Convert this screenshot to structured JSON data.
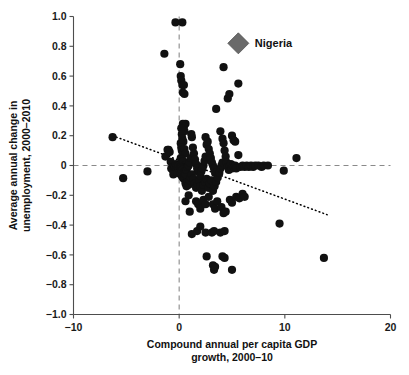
{
  "chart_data": {
    "type": "scatter",
    "title": "",
    "xlabel": "Compound annual per capita GDP growth, 2000–10",
    "xlabel_line1": "Compound annual per capita GDP",
    "xlabel_line2": "growth, 2000–10",
    "ylabel": "Average annual change in unemployment, 2000–2010",
    "ylabel_line1": "Average annual change in",
    "ylabel_line2": "unemployment, 2000–2010",
    "xlim": [
      -10,
      20
    ],
    "ylim": [
      -1.0,
      1.0
    ],
    "xticks": [
      -10,
      0,
      10,
      20
    ],
    "xtick_labels": [
      "−10",
      "0",
      "10",
      "20"
    ],
    "yticks": [
      1.0,
      0.8,
      0.6,
      0.4,
      0.2,
      0,
      -0.2,
      -0.4,
      -0.6,
      -0.8,
      -1.0
    ],
    "ytick_labels": [
      "1.0",
      "0.8",
      "0.6",
      "0.4",
      "0.2",
      "0",
      "−0.2",
      "−0.4",
      "−0.6",
      "−0.8",
      "−1.0"
    ],
    "grid": false,
    "legend_position": "none",
    "reference_lines": [
      {
        "name": "zero-unemployment-change",
        "orientation": "horizontal",
        "value": 0,
        "style": "dashed"
      },
      {
        "name": "zero-gdp-growth",
        "orientation": "vertical",
        "value": 0,
        "style": "dashed"
      }
    ],
    "trend_line": {
      "name": "fitted-trend",
      "style": "dotted",
      "x_start": -6.3,
      "y_start": 0.2,
      "x_end": 14.0,
      "y_end": -0.33,
      "slope": -0.026,
      "intercept": 0.036
    },
    "series": [
      {
        "name": "countries",
        "marker": "circle",
        "color": "#111111",
        "points": [
          [
            -6.3,
            0.19
          ],
          [
            -5.3,
            -0.085
          ],
          [
            -3.0,
            -0.04
          ],
          [
            -1.4,
            0.75
          ],
          [
            -1.3,
            0.06
          ],
          [
            -1.1,
            0.105
          ],
          [
            -1.0,
            0.105
          ],
          [
            -0.9,
            0.09
          ],
          [
            -0.8,
            0.025
          ],
          [
            -0.75,
            -0.02
          ],
          [
            -0.6,
            -0.03
          ],
          [
            -0.55,
            -0.06
          ],
          [
            -0.5,
            -0.005
          ],
          [
            -0.45,
            0.0
          ],
          [
            -0.4,
            -0.01
          ],
          [
            -0.35,
            0.96
          ],
          [
            -0.3,
            0.01
          ],
          [
            -0.25,
            -0.02
          ],
          [
            -0.2,
            0.0
          ],
          [
            -0.15,
            -0.05
          ],
          [
            -0.1,
            -0.015
          ],
          [
            -0.05,
            0.0
          ],
          [
            0.3,
            0.96
          ],
          [
            0.1,
            0.68
          ],
          [
            0.15,
            0.6
          ],
          [
            0.2,
            0.57
          ],
          [
            0.3,
            0.54
          ],
          [
            0.35,
            0.49
          ],
          [
            0.45,
            0.54
          ],
          [
            0.5,
            0.48
          ],
          [
            0.6,
            0.28
          ],
          [
            0.35,
            0.28
          ],
          [
            0.45,
            0.26
          ],
          [
            0.5,
            0.23
          ],
          [
            0.2,
            0.25
          ],
          [
            0.25,
            0.21
          ],
          [
            0.3,
            0.18
          ],
          [
            0.4,
            0.16
          ],
          [
            0.15,
            0.15
          ],
          [
            0.2,
            0.12
          ],
          [
            0.25,
            0.1
          ],
          [
            0.35,
            0.09
          ],
          [
            0.5,
            0.11
          ],
          [
            0.6,
            0.08
          ],
          [
            0.15,
            0.05
          ],
          [
            0.25,
            0.04
          ],
          [
            0.3,
            0.02
          ],
          [
            0.4,
            0.03
          ],
          [
            0.5,
            0.0
          ],
          [
            0.55,
            -0.01
          ],
          [
            0.1,
            -0.01
          ],
          [
            0.2,
            -0.02
          ],
          [
            0.3,
            -0.03
          ],
          [
            0.4,
            -0.05
          ],
          [
            0.15,
            -0.06
          ],
          [
            0.25,
            -0.07
          ],
          [
            0.35,
            -0.08
          ],
          [
            0.45,
            -0.09
          ],
          [
            0.6,
            -0.06
          ],
          [
            0.7,
            -0.03
          ],
          [
            0.8,
            -0.01
          ],
          [
            0.9,
            0.0
          ],
          [
            1.0,
            0.02
          ],
          [
            1.1,
            0.05
          ],
          [
            1.2,
            0.19
          ],
          [
            1.15,
            0.21
          ],
          [
            1.3,
            0.12
          ],
          [
            1.4,
            0.08
          ],
          [
            1.5,
            0.04
          ],
          [
            1.6,
            0.01
          ],
          [
            1.7,
            -0.02
          ],
          [
            1.8,
            -0.04
          ],
          [
            0.6,
            -0.12
          ],
          [
            0.7,
            -0.14
          ],
          [
            0.8,
            -0.11
          ],
          [
            0.9,
            -0.13
          ],
          [
            1.0,
            -0.1
          ],
          [
            1.1,
            -0.08
          ],
          [
            1.2,
            -0.06
          ],
          [
            1.35,
            -0.09
          ],
          [
            1.5,
            -0.12
          ],
          [
            1.6,
            -0.15
          ],
          [
            1.75,
            -0.13
          ],
          [
            1.9,
            -0.1
          ],
          [
            2.0,
            -0.07
          ],
          [
            2.1,
            -0.04
          ],
          [
            2.2,
            -0.02
          ],
          [
            2.3,
            0.0
          ],
          [
            2.4,
            0.03
          ],
          [
            2.5,
            0.06
          ],
          [
            2.6,
            0.14
          ],
          [
            2.5,
            0.19
          ],
          [
            2.7,
            0.16
          ],
          [
            2.8,
            0.11
          ],
          [
            2.9,
            0.08
          ],
          [
            3.0,
            0.05
          ],
          [
            3.1,
            0.02
          ],
          [
            3.2,
            0.0
          ],
          [
            3.3,
            -0.02
          ],
          [
            3.4,
            -0.05
          ],
          [
            2.0,
            -0.14
          ],
          [
            2.15,
            -0.17
          ],
          [
            2.3,
            -0.13
          ],
          [
            2.45,
            -0.11
          ],
          [
            2.6,
            -0.09
          ],
          [
            2.75,
            -0.15
          ],
          [
            2.9,
            -0.12
          ],
          [
            3.05,
            -0.1
          ],
          [
            3.2,
            -0.17
          ],
          [
            3.35,
            -0.14
          ],
          [
            3.5,
            -0.11
          ],
          [
            3.65,
            -0.08
          ],
          [
            3.8,
            -0.05
          ],
          [
            3.9,
            -0.02
          ],
          [
            4.0,
            0.0
          ],
          [
            4.1,
            0.02
          ],
          [
            3.5,
            0.38
          ],
          [
            3.9,
            0.23
          ],
          [
            4.1,
            0.18
          ],
          [
            4.2,
            0.15
          ],
          [
            4.3,
            0.1
          ],
          [
            4.4,
            0.06
          ],
          [
            4.5,
            0.02
          ],
          [
            4.6,
            -0.01
          ],
          [
            4.7,
            -0.03
          ],
          [
            4.8,
            0.0
          ],
          [
            4.9,
            0.01
          ],
          [
            5.0,
            -0.02
          ],
          [
            5.1,
            0.0
          ],
          [
            5.2,
            -0.01
          ],
          [
            5.3,
            0.0
          ],
          [
            5.4,
            -0.02
          ],
          [
            4.2,
            0.66
          ],
          [
            4.6,
            0.45
          ],
          [
            4.75,
            0.48
          ],
          [
            5.6,
            0.55
          ],
          [
            5.0,
            0.2
          ],
          [
            5.15,
            0.17
          ],
          [
            5.3,
            0.16
          ],
          [
            5.6,
            0.07
          ],
          [
            5.8,
            -0.01
          ],
          [
            6.0,
            0.0
          ],
          [
            6.2,
            -0.01
          ],
          [
            6.4,
            0.0
          ],
          [
            6.6,
            -0.01
          ],
          [
            6.8,
            0.0
          ],
          [
            7.0,
            -0.01
          ],
          [
            7.2,
            0.0
          ],
          [
            7.5,
            0.0
          ],
          [
            7.8,
            -0.01
          ],
          [
            8.0,
            0.0
          ],
          [
            8.4,
            0.0
          ],
          [
            9.9,
            -0.035
          ],
          [
            11.1,
            0.05
          ],
          [
            0.6,
            -0.24
          ],
          [
            0.9,
            -0.2
          ],
          [
            1.0,
            -0.31
          ],
          [
            1.6,
            -0.24
          ],
          [
            1.8,
            -0.26
          ],
          [
            2.0,
            -0.29
          ],
          [
            2.3,
            -0.23
          ],
          [
            2.5,
            -0.26
          ],
          [
            2.8,
            -0.21
          ],
          [
            3.2,
            -0.26
          ],
          [
            3.4,
            -0.29
          ],
          [
            3.6,
            -0.24
          ],
          [
            4.0,
            -0.28
          ],
          [
            4.2,
            -0.32
          ],
          [
            4.4,
            -0.31
          ],
          [
            4.8,
            -0.23
          ],
          [
            5.0,
            -0.25
          ],
          [
            5.4,
            -0.21
          ],
          [
            5.7,
            -0.22
          ],
          [
            6.0,
            -0.19
          ],
          [
            6.2,
            -0.21
          ],
          [
            1.2,
            -0.46
          ],
          [
            1.7,
            -0.44
          ],
          [
            2.0,
            -0.41
          ],
          [
            2.5,
            -0.45
          ],
          [
            3.1,
            -0.45
          ],
          [
            3.3,
            -0.44
          ],
          [
            3.9,
            -0.45
          ],
          [
            4.3,
            -0.44
          ],
          [
            2.6,
            -0.61
          ],
          [
            3.2,
            -0.67
          ],
          [
            3.3,
            -0.7
          ],
          [
            3.4,
            -0.68
          ],
          [
            4.1,
            -0.61
          ],
          [
            4.3,
            -0.62
          ],
          [
            5.0,
            -0.7
          ],
          [
            9.5,
            -0.39
          ],
          [
            13.7,
            -0.62
          ]
        ]
      },
      {
        "name": "Nigeria",
        "marker": "diamond",
        "color": "#6a6a6a",
        "label": "Nigeria",
        "points": [
          [
            5.6,
            0.82
          ]
        ]
      }
    ]
  }
}
